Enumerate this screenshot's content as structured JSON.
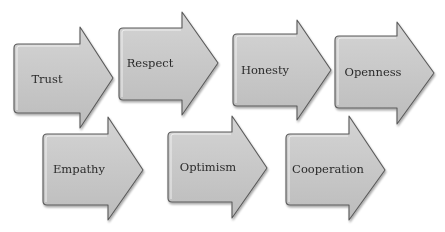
{
  "diagram": {
    "type": "arrow-flow",
    "colors": {
      "fill_light": "#d2d2d2",
      "fill_dark": "#bdbdbd",
      "outline": "#5a5a5a",
      "text": "#2b2b2b",
      "background": "#ffffff"
    },
    "rows": [
      {
        "arrows": [
          {
            "label": "Trust",
            "body": [
              14,
              44,
              80,
              113
            ],
            "head": [
              27,
              113,
              128
            ],
            "text_at": [
              47,
              79
            ]
          },
          {
            "label": "Respect",
            "body": [
              119,
              28,
              182,
              100
            ],
            "head": [
              12,
              218,
              115
            ],
            "text_at": [
              150,
              64
            ]
          },
          {
            "label": "Honesty",
            "body": [
              233,
              34,
              297,
              106
            ],
            "head": [
              20,
              331,
              120
            ],
            "text_at": [
              265,
              71
            ]
          },
          {
            "label": "Openness",
            "body": [
              335,
              36,
              397,
              108
            ],
            "head": [
              22,
              434,
              124
            ],
            "text_at": [
              372,
              73
            ]
          }
        ]
      },
      {
        "arrows": [
          {
            "label": "Empathy",
            "body": [
              43,
              134,
              108,
              205
            ],
            "head": [
              117,
              143,
              220
            ],
            "text_at": [
              78,
              170
            ]
          },
          {
            "label": "Optimism",
            "body": [
              168,
              132,
              232,
              202
            ],
            "head": [
              116,
              267,
              218
            ],
            "text_at": [
              208,
              168
            ]
          },
          {
            "label": "Cooperation",
            "body": [
              286,
              134,
              349,
              205
            ],
            "head": [
              116,
              385,
              220
            ],
            "text_at": [
              328,
              170
            ]
          }
        ]
      }
    ]
  },
  "labels": {
    "trust": "Trust",
    "respect": "Respect",
    "honesty": "Honesty",
    "openness": "Openness",
    "empathy": "Empathy",
    "optimism": "Optimism",
    "cooperation": "Cooperation"
  }
}
